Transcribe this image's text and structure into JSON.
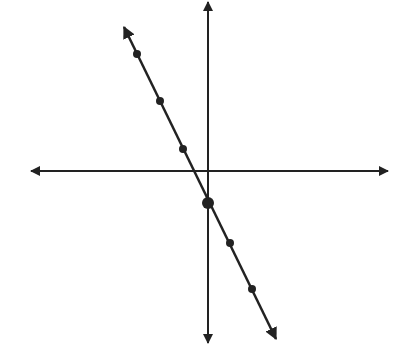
{
  "chart_data": {
    "type": "line",
    "title": "",
    "xlabel": "",
    "ylabel": "",
    "grid": false,
    "legend": null,
    "axes": {
      "origin_px": [
        208,
        171
      ],
      "x_axis": {
        "from_px": [
          31,
          171
        ],
        "to_px": [
          388,
          171
        ],
        "arrows": "both"
      },
      "y_axis": {
        "from_px": [
          208,
          2
        ],
        "to_px": [
          208,
          343
        ],
        "arrows": "both"
      }
    },
    "series": [
      {
        "name": "line",
        "slope_sign": "negative",
        "line_px": {
          "from": [
            124,
            27
          ],
          "to": [
            276,
            339
          ],
          "arrows": "both"
        },
        "points_px": [
          {
            "x": 137,
            "y": 54,
            "size": "small"
          },
          {
            "x": 160,
            "y": 101,
            "size": "small"
          },
          {
            "x": 183,
            "y": 149,
            "size": "small"
          },
          {
            "x": 208,
            "y": 203,
            "size": "large",
            "note": "y-intercept"
          },
          {
            "x": 230,
            "y": 243,
            "size": "small"
          },
          {
            "x": 252,
            "y": 289,
            "size": "small"
          }
        ]
      }
    ],
    "colors": {
      "ink": "#222222",
      "background": "#ffffff"
    }
  }
}
